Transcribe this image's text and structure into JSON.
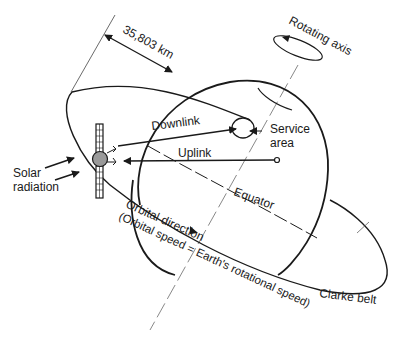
{
  "diagram": {
    "type": "geostationary-satellite-orbit",
    "labels": {
      "distance": "35,803 km",
      "rotating_axis": "Rotating axis",
      "downlink": "Downlink",
      "uplink": "Uplink",
      "service_area_line1": "Service",
      "service_area_line2": "area",
      "solar_line1": "Solar",
      "solar_line2": "radiation",
      "equator": "Equator",
      "orbital_direction": "Orbital direction",
      "orbital_speed": "(Orbital speed = Earth's rotational speed)",
      "clarke_belt": "Clarke belt"
    },
    "colors": {
      "line": "#1a1a1a",
      "satellite_body": "#9a9a9a",
      "background": "#ffffff"
    }
  }
}
